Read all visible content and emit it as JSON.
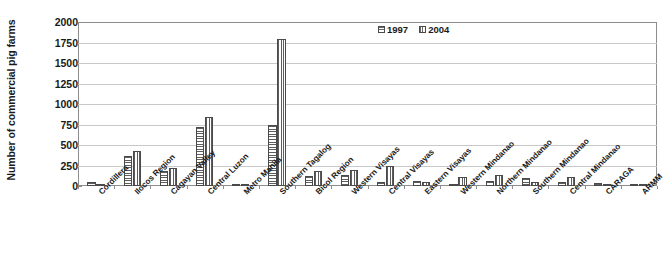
{
  "chart_data": {
    "type": "bar",
    "title": "",
    "xlabel": "",
    "ylabel": "Number of commercial pig farms",
    "ylim": [
      0,
      2000
    ],
    "ytick_step": 250,
    "yticks": [
      2000,
      1750,
      1500,
      1250,
      1000,
      750,
      500,
      250,
      0
    ],
    "grid": true,
    "legend_position": "top-center",
    "categories": [
      "Cordillera",
      "Ilocos Region",
      "Cagayan Valley",
      "Central Luzon",
      "Metro Manila",
      "Southern Tagalog",
      "Bicol Region",
      "Western Visayas",
      "Central Visayas",
      "Eastern Visayas",
      "Western Mindanao",
      "Northern Mindanao",
      "Southern Mindanao",
      "Central Mindanao",
      "CARAGA",
      "ARMM"
    ],
    "series": [
      {
        "name": "1997",
        "pattern": "horizontal-hatch",
        "values": [
          55,
          365,
          180,
          715,
          30,
          750,
          120,
          135,
          50,
          60,
          25,
          60,
          100,
          45,
          40,
          10
        ]
      },
      {
        "name": "2004",
        "pattern": "vertical-hatch",
        "values": [
          28,
          430,
          215,
          845,
          5,
          1790,
          180,
          190,
          240,
          45,
          105,
          135,
          55,
          110,
          25,
          3
        ]
      }
    ]
  },
  "legend": {
    "items": [
      {
        "label": "1997"
      },
      {
        "label": "2004"
      }
    ]
  },
  "colors": {
    "axis": "#8d8d8d",
    "gridline": "#c9c9c9",
    "bar_outline": "#4a4a4a",
    "hatch": "#5d5d5d",
    "text": "#1a1a1a",
    "background": "#ffffff"
  }
}
